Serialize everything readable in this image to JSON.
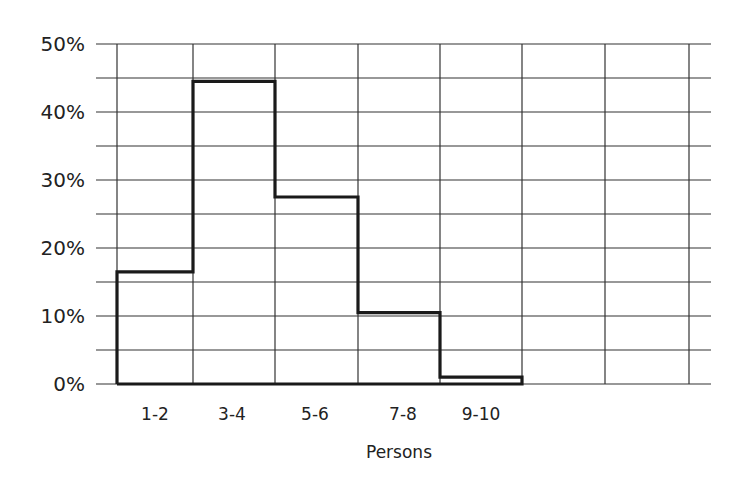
{
  "chart_data": {
    "type": "bar",
    "style": "step-histogram",
    "title": "",
    "xlabel": "Persons",
    "ylabel": "",
    "categories": [
      "1-2",
      "3-4",
      "5-6",
      "7-8",
      "9-10"
    ],
    "values": [
      16.5,
      44.5,
      27.5,
      10.5,
      1
    ],
    "unit": "%",
    "ylim": [
      0,
      50
    ],
    "yticks": [
      "0%",
      "10%",
      "20%",
      "30%",
      "40%",
      "50%"
    ],
    "grid": true,
    "grid_minor_step": 5,
    "empty_columns_right": 3,
    "legend": null
  },
  "axis": {
    "y_labels": [
      "50%",
      "40%",
      "30%",
      "20%",
      "10%",
      "0%"
    ],
    "x_labels": [
      "1-2",
      "3-4",
      "5-6",
      "7-8",
      "9-10"
    ],
    "x_title": "Persons"
  },
  "colors": {
    "grid": "#333333",
    "bars": "#1a1a1a",
    "text": "#222222"
  }
}
